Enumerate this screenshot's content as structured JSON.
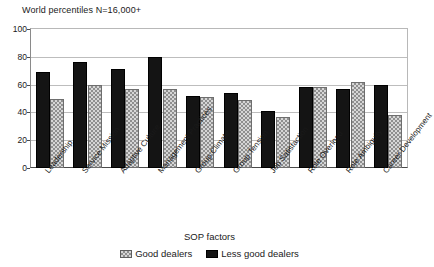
{
  "chart_data": {
    "type": "bar",
    "title": "World percentiles N=16,000+",
    "xlabel": "SOP factors",
    "ylabel": "",
    "ylim": [
      0,
      100
    ],
    "yticks": [
      0,
      20,
      40,
      60,
      80,
      100
    ],
    "grid": true,
    "legend_position": "bottom",
    "categories": [
      "Leadership",
      "Service Mission",
      "Adaptive Culture",
      "Management Practices",
      "Group Climate",
      "Group Tension",
      "Job Satisfaction",
      "Role Overload",
      "Role Ambiguity",
      "Career Development"
    ],
    "series": [
      {
        "name": "Less good dealers",
        "color": "#141414",
        "pattern": "solid",
        "values": [
          69,
          76,
          71,
          80,
          52,
          54,
          41,
          58,
          57,
          60
        ]
      },
      {
        "name": "Good dealers",
        "color": "#d6d6d6",
        "pattern": "checkered",
        "values": [
          50,
          60,
          57,
          57,
          51,
          49,
          37,
          58,
          62,
          38
        ]
      }
    ]
  },
  "axis": {
    "x_title": "SOP factors"
  },
  "legend": {
    "items": [
      {
        "label": "Good dealers",
        "swatch": "checkered"
      },
      {
        "label": "Less good dealers",
        "swatch": "solid"
      }
    ]
  }
}
